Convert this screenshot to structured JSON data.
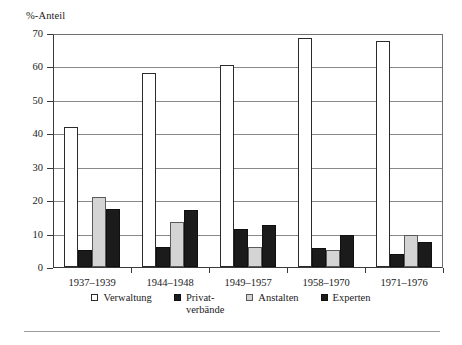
{
  "chart_data": {
    "type": "bar",
    "title": "",
    "subtitle": "",
    "ylabel": "%-Anteil",
    "xlabel": "",
    "ylim": [
      0,
      70
    ],
    "yticks": [
      0,
      10,
      20,
      30,
      40,
      50,
      60,
      70
    ],
    "grid": true,
    "legend_position": "bottom",
    "categories": [
      "1937–1939",
      "1944–1948",
      "1949–1957",
      "1958–1970",
      "1971–1976"
    ],
    "series": [
      {
        "name": "Verwaltung",
        "color": "#ffffff",
        "values": [
          42.0,
          58.0,
          60.5,
          68.5,
          67.5
        ]
      },
      {
        "name": "Privat-\nverbände",
        "color": "#1b1b1b",
        "values": [
          5.0,
          6.0,
          11.5,
          5.8,
          4.0
        ]
      },
      {
        "name": "Anstalten",
        "color": "#d4d4d4",
        "values": [
          21.0,
          13.5,
          6.0,
          5.0,
          9.5
        ]
      },
      {
        "name": "Experten",
        "color": "#1b1b1b",
        "values": [
          17.5,
          17.0,
          12.5,
          9.5,
          7.5
        ]
      }
    ]
  }
}
